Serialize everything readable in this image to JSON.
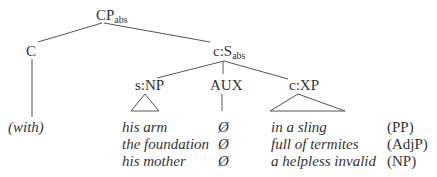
{
  "tree": {
    "root": {
      "label": "CP",
      "sub": "abs"
    },
    "complementizer": {
      "label": "C",
      "leaf": "(with)"
    },
    "clause": {
      "label": "c:S",
      "sub": "abs"
    },
    "subject": {
      "label": "s:NP"
    },
    "aux": {
      "label": "AUX"
    },
    "predicate": {
      "label": "c:XP"
    }
  },
  "rows": [
    {
      "subject": "his arm",
      "aux": "Ø",
      "predicate": "in a sling",
      "category": "(PP)"
    },
    {
      "subject": "the foundation",
      "aux": "Ø",
      "predicate": "full of termites",
      "category": "(AdjP)"
    },
    {
      "subject": "his mother",
      "aux": "Ø",
      "predicate": "a helpless invalid",
      "category": "(NP)"
    }
  ],
  "colors": {
    "line": "#555555",
    "text": "#333333"
  }
}
